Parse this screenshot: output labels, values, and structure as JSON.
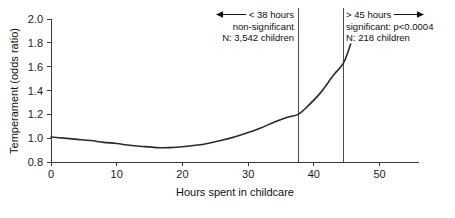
{
  "chart_data": {
    "type": "line",
    "title": "",
    "xlabel": "Hours spent in childcare",
    "ylabel": "Temperament (odds ratio)",
    "xlim": [
      0,
      56
    ],
    "ylim": [
      0.8,
      2.0
    ],
    "xticks": [
      "0",
      "10",
      "20",
      "30",
      "40",
      "50"
    ],
    "xtick_values": [
      0,
      10,
      20,
      30,
      40,
      50
    ],
    "yticks": [
      "0.8",
      "1.0",
      "1.2",
      "1.4",
      "1.6",
      "1.8",
      "2.0"
    ],
    "ytick_values": [
      0.8,
      1.0,
      1.2,
      1.4,
      1.6,
      1.8,
      2.0
    ],
    "grid": false,
    "legend": "none",
    "series": [
      {
        "name": "odds ratio",
        "x": [
          0,
          2,
          4,
          6,
          8,
          10,
          12,
          14,
          16,
          17,
          18,
          20,
          22,
          24,
          26,
          28,
          30,
          32,
          34,
          36,
          37.6,
          39,
          41,
          43,
          44.5,
          45.6
        ],
        "values": [
          1.01,
          1.0,
          0.99,
          0.98,
          0.965,
          0.955,
          0.94,
          0.93,
          0.921,
          0.92,
          0.921,
          0.928,
          0.94,
          0.958,
          0.982,
          1.012,
          1.048,
          1.088,
          1.135,
          1.175,
          1.2,
          1.265,
          1.38,
          1.53,
          1.63,
          1.79
        ]
      }
    ],
    "vertical_markers": [
      {
        "name": "threshold-38",
        "x": 37.6
      },
      {
        "name": "threshold-45",
        "x": 44.5
      }
    ]
  },
  "annotations": {
    "left": {
      "arrow": "left-arrow-icon",
      "line1": "< 38 hours",
      "line2": "non-significant",
      "line3": "N: 3,542 children"
    },
    "right": {
      "arrow": "right-arrow-icon",
      "line1": "> 45 hours",
      "line2": "significant: p<0.0004",
      "line3": "N: 218 children"
    }
  },
  "colors": {
    "curve": "#2b2b2b",
    "axis": "#3a3a3a",
    "marker": "#4a4a4a",
    "text": "#111111",
    "background": "#ffffff"
  }
}
